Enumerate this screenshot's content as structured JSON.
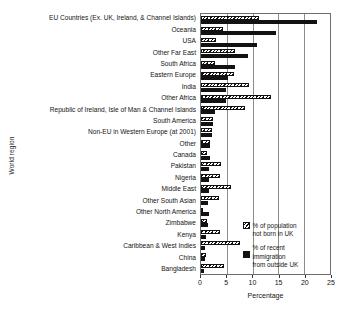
{
  "chart_data": {
    "type": "bar",
    "orientation": "horizontal",
    "title": "",
    "xlabel": "Percentage",
    "ylabel": "World region",
    "xlim": [
      0,
      25
    ],
    "xticks": [
      0,
      5,
      10,
      15,
      20,
      25
    ],
    "grid": "vertical",
    "legend_position": "inside-bottom-right",
    "categories": [
      "EU Countries (Ex. UK, Ireland, & Channel Islands)",
      "Oceania",
      "USA",
      "Other Far East",
      "South Africa",
      "Eastern Europe",
      "India",
      "Other Africa",
      "Republic of Ireland, Isle of Man & Channel Islands",
      "South America",
      "Non-EU in Western Europe (at 2001)",
      "Other",
      "Canada",
      "Pakistan",
      "Nigeria",
      "Middle East",
      "Other South Asian",
      "Other North America",
      "Zimbabwe",
      "Kenya",
      "Caribbean & West Indies",
      "China",
      "Bangladesh"
    ],
    "series": [
      {
        "name": "% of population not born in UK",
        "style": "hatched",
        "color": "#111111",
        "values": [
          11.2,
          4.3,
          2.9,
          6.6,
          2.8,
          6.3,
          9.3,
          13.6,
          8.6,
          2.4,
          2.1,
          1.7,
          1.1,
          3.9,
          3.7,
          5.9,
          3.4,
          0.2,
          1.1,
          3.6,
          7.5,
          0.9,
          4.4
        ]
      },
      {
        "name": "% of recent immigration from outside UK",
        "style": "solid",
        "color": "#121212",
        "values": [
          22.5,
          14.6,
          10.8,
          9.2,
          6.5,
          5.2,
          4.9,
          4.8,
          2.7,
          2.3,
          2.1,
          1.8,
          1.8,
          1.6,
          1.6,
          1.5,
          1.3,
          1.5,
          1.3,
          1.0,
          0.7,
          0.8,
          0.6
        ]
      }
    ]
  },
  "legend": {
    "entries": [
      {
        "line1": "% of population",
        "line2": "not born in UK"
      },
      {
        "line1": "% of recent",
        "line2": "immigration",
        "line3": "from outside UK"
      }
    ]
  },
  "axis": {
    "xlabel": "Percentage",
    "ylabel": "World region",
    "tick_labels": [
      "0",
      "5",
      "10",
      "15",
      "20",
      "25"
    ]
  }
}
